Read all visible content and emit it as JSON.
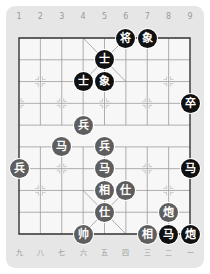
{
  "board": {
    "files_top": [
      "1",
      "2",
      "3",
      "4",
      "5",
      "6",
      "7",
      "8",
      "9"
    ],
    "files_bottom": [
      "九",
      "八",
      "七",
      "六",
      "五",
      "四",
      "三",
      "二",
      "一"
    ],
    "colors": {
      "panel": "#e6e6e6",
      "board": "#f7f7f7",
      "grid": "#9a9a9a",
      "border": "#333333",
      "red_piece": "#5e5e5e",
      "black_piece": "#111111"
    }
  },
  "pieces": [
    {
      "label": "将",
      "side": "black",
      "col": 5,
      "row": 0
    },
    {
      "label": "象",
      "side": "black",
      "col": 6,
      "row": 0
    },
    {
      "label": "士",
      "side": "black",
      "col": 4,
      "row": 1
    },
    {
      "label": "士",
      "side": "black",
      "col": 3,
      "row": 2
    },
    {
      "label": "象",
      "side": "black",
      "col": 4,
      "row": 2
    },
    {
      "label": "卒",
      "side": "black",
      "col": 8,
      "row": 3
    },
    {
      "label": "兵",
      "side": "red",
      "col": 3,
      "row": 4
    },
    {
      "label": "马",
      "side": "red",
      "col": 2,
      "row": 5
    },
    {
      "label": "兵",
      "side": "red",
      "col": 4,
      "row": 5
    },
    {
      "label": "兵",
      "side": "red",
      "col": 0,
      "row": 6
    },
    {
      "label": "马",
      "side": "red",
      "col": 4,
      "row": 6
    },
    {
      "label": "马",
      "side": "black",
      "col": 8,
      "row": 6
    },
    {
      "label": "相",
      "side": "red",
      "col": 4,
      "row": 7
    },
    {
      "label": "仕",
      "side": "red",
      "col": 5,
      "row": 7
    },
    {
      "label": "仕",
      "side": "red",
      "col": 4,
      "row": 8
    },
    {
      "label": "炮",
      "side": "red",
      "col": 7,
      "row": 8
    },
    {
      "label": "帅",
      "side": "red",
      "col": 3,
      "row": 9
    },
    {
      "label": "相",
      "side": "red",
      "col": 6,
      "row": 9
    },
    {
      "label": "马",
      "side": "black",
      "col": 7,
      "row": 9
    },
    {
      "label": "炮",
      "side": "black",
      "col": 8,
      "row": 9
    }
  ]
}
